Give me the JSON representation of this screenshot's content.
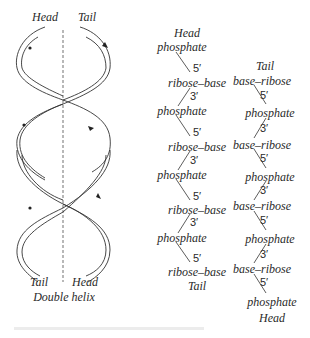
{
  "figure": {
    "title": "Double helix",
    "helix": {
      "top_left_label": "Head",
      "top_right_label": "Tail",
      "bottom_left_label": "Tail",
      "bottom_right_label": "Head",
      "caption": "Double helix"
    },
    "left_strand": {
      "top_label": "Head",
      "bottom_label": "Tail",
      "items": [
        {
          "text": "phosphate"
        },
        {
          "prime": "5′"
        },
        {
          "text": "ribose–base"
        },
        {
          "prime": "3′"
        },
        {
          "text": "phosphate"
        },
        {
          "prime": "5′"
        },
        {
          "text": "ribose–base"
        },
        {
          "prime": "3′"
        },
        {
          "text": "phosphate"
        },
        {
          "prime": "5′"
        },
        {
          "text": "ribose–base"
        },
        {
          "prime": "3′"
        },
        {
          "text": "phosphate"
        },
        {
          "prime": "5′"
        },
        {
          "text": "ribose–base"
        }
      ]
    },
    "right_strand": {
      "top_label": "Tail",
      "bottom_label": "Head",
      "items": [
        {
          "text": "base–ribose"
        },
        {
          "prime": "5′"
        },
        {
          "text": "phosphate"
        },
        {
          "prime": "3′"
        },
        {
          "text": "base–ribose"
        },
        {
          "prime": "5′"
        },
        {
          "text": "phosphate"
        },
        {
          "prime": "3′"
        },
        {
          "text": "base–ribose"
        },
        {
          "prime": "5′"
        },
        {
          "text": "phosphate"
        },
        {
          "prime": "3′"
        },
        {
          "text": "base–ribose"
        },
        {
          "prime": "5′"
        },
        {
          "text": "phosphate"
        }
      ]
    },
    "colors": {
      "ink": "#2a2a2a",
      "background": "#ffffff"
    }
  }
}
